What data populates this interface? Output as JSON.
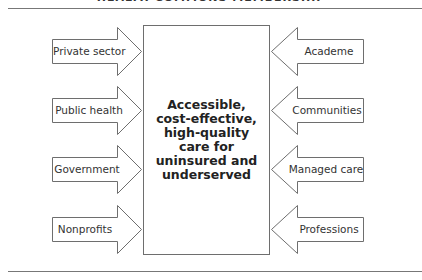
{
  "title": "HEALTH COMMONS MEMBERSHIP",
  "center": {
    "lines": [
      "Accessible,",
      "cost-effective,",
      "high-quality",
      "care for",
      "uninsured and",
      "underserved"
    ]
  },
  "left_arrows": [
    {
      "label": "Private sector"
    },
    {
      "label": "Public health"
    },
    {
      "label": "Government"
    },
    {
      "label": "Nonprofits"
    }
  ],
  "right_arrows": [
    {
      "label": "Academe"
    },
    {
      "label": "Communities"
    },
    {
      "label": "Managed care"
    },
    {
      "label": "Professions"
    }
  ],
  "colors": {
    "line": "#6e6e6e",
    "text": "#222222",
    "background": "#ffffff"
  }
}
